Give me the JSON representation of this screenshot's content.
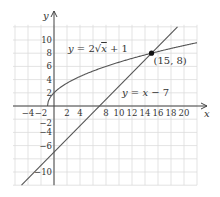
{
  "chart_data": {
    "type": "line",
    "title": "",
    "xlabel": "x",
    "ylabel": "y",
    "xlim": [
      -6,
      22
    ],
    "ylim": [
      -12,
      12
    ],
    "grid": true,
    "grid_step": 2,
    "x_ticks": [
      "-4",
      "-2",
      "2",
      "4",
      "8",
      "10",
      "12",
      "14",
      "16",
      "18",
      "20"
    ],
    "y_ticks": [
      "10",
      "8",
      "6",
      "4",
      "2",
      "-2",
      "-4",
      "-6",
      "-10"
    ],
    "series": [
      {
        "name": "y = 2√x + 1",
        "expr": "2*sqrt(x+1)",
        "domain": [
          -1,
          22
        ],
        "color": "#555555"
      },
      {
        "name": "y = x − 7",
        "expr": "x-7",
        "domain": [
          -5,
          19
        ],
        "color": "#555555"
      }
    ],
    "annotations": [
      {
        "text": "(15, 8)",
        "x": 15,
        "y": 8,
        "type": "point"
      }
    ],
    "labels": {
      "curve": "y = 2√x + 1",
      "line": "y = x − 7",
      "point": "(15, 8)",
      "x_axis": "x",
      "y_axis": "y"
    }
  }
}
